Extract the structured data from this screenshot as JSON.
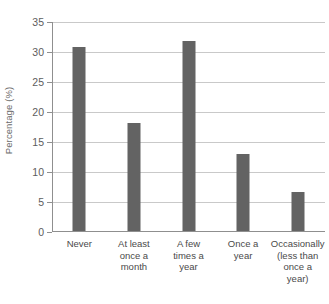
{
  "chart_data": {
    "type": "bar",
    "title": "",
    "xlabel": "",
    "ylabel": "Percentage (%)",
    "categories": [
      "Never",
      "At least\nonce a\nmonth",
      "A few\ntimes a\nyear",
      "Once a\nyear",
      "Occasionally\n(less than\nonce a\nyear)"
    ],
    "values": [
      30.7,
      18.0,
      31.7,
      12.8,
      6.5
    ],
    "ylim": [
      0,
      35
    ],
    "yticks": [
      0,
      5,
      10,
      15,
      20,
      25,
      30,
      35
    ],
    "ytick_labels": [
      "0",
      "5",
      "10",
      "15",
      "20",
      "25",
      "30",
      "35"
    ],
    "grid": true,
    "legend": "none",
    "bar_color": "#636363",
    "grid_color": "#c9c9c9",
    "axis_color": "#8f8f8f",
    "background": "#ffffff"
  },
  "axes": {
    "y_title": "Percentage (%)"
  }
}
